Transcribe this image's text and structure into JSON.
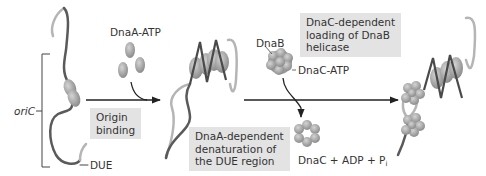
{
  "diagram": {
    "type": "process-flow",
    "labels": {
      "oric": "oriC",
      "due": "DUE",
      "dnaa_atp": "DnaA-ATP",
      "dnab": "DnaB",
      "dnac_atp": "DnaC-ATP",
      "products_main": "DnaC + ADP + P",
      "products_sub": "i"
    },
    "steps": [
      {
        "id": "step1",
        "label_lines": [
          "Origin",
          "binding"
        ]
      },
      {
        "id": "step2",
        "label_lines": [
          "DnaA-dependent",
          "denaturation of",
          "the DUE region"
        ]
      },
      {
        "id": "step3",
        "label_lines": [
          "DnaC-dependent",
          "loading of DnaB",
          "helicase"
        ]
      }
    ],
    "colors": {
      "box_fill": "#e3e3e3",
      "dna_dark": "#5a5a5a",
      "dna_light": "#b5b5b5",
      "protein": "#a8a8a8",
      "arrow": "#222222"
    }
  }
}
